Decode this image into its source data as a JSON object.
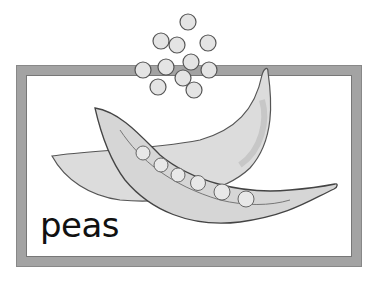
{
  "card": {
    "label": "peas",
    "colors": {
      "border": "#a3a3a3",
      "pod": "#d8d8d8",
      "pod_dark": "#bdbdbd",
      "pea": "#e6e6e6",
      "outline": "#555555"
    }
  }
}
